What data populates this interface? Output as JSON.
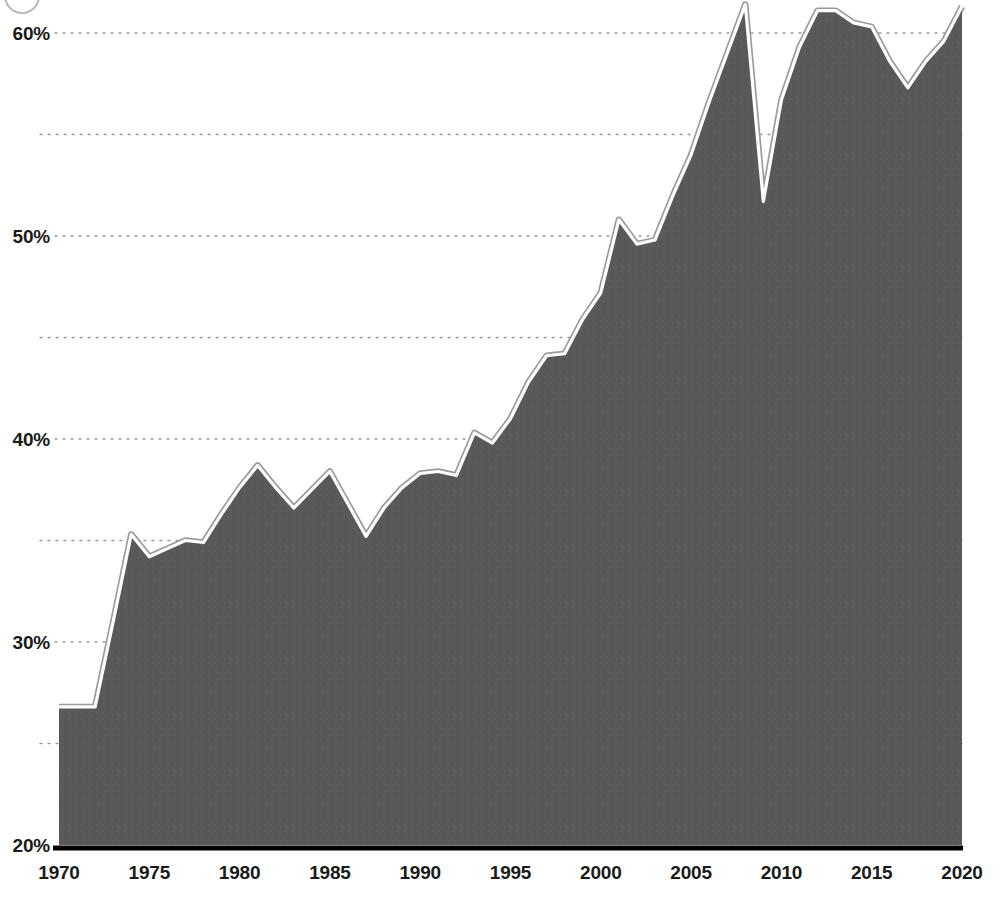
{
  "chart_data": {
    "type": "area",
    "title": "",
    "xlabel": "",
    "ylabel": "",
    "xlim": [
      1970,
      2020
    ],
    "ylim": [
      20,
      62
    ],
    "grid": true,
    "legend": null,
    "y_tick_labels": [
      "60%",
      "50%",
      "40%",
      "30%",
      "20%"
    ],
    "y_ticks": [
      60,
      50,
      40,
      30,
      20
    ],
    "y_minor_gridlines": [
      55,
      45,
      35,
      25
    ],
    "x_tick_labels": [
      "1970",
      "1975",
      "1980",
      "1985",
      "1990",
      "1995",
      "2000",
      "2005",
      "2010",
      "2015",
      "2020"
    ],
    "x_ticks": [
      1970,
      1975,
      1980,
      1985,
      1990,
      1995,
      2000,
      2005,
      2010,
      2015,
      2020
    ],
    "x": [
      1970,
      1971,
      1972,
      1973,
      1974,
      1975,
      1976,
      1977,
      1978,
      1979,
      1980,
      1981,
      1982,
      1983,
      1984,
      1985,
      1986,
      1987,
      1988,
      1989,
      1990,
      1991,
      1992,
      1993,
      1994,
      1995,
      1996,
      1997,
      1998,
      1999,
      2000,
      2001,
      2002,
      2003,
      2004,
      2005,
      2006,
      2007,
      2008,
      2009,
      2010,
      2011,
      2012,
      2013,
      2014,
      2015,
      2016,
      2017,
      2018,
      2019,
      2020
    ],
    "values": [
      26.8,
      26.8,
      26.8,
      31.0,
      35.3,
      34.2,
      34.6,
      35.0,
      34.9,
      36.3,
      37.6,
      38.7,
      37.6,
      36.6,
      37.5,
      38.4,
      36.8,
      35.2,
      36.6,
      37.6,
      38.3,
      38.4,
      38.2,
      40.3,
      39.8,
      41.0,
      42.8,
      44.1,
      44.2,
      45.9,
      47.2,
      50.8,
      49.6,
      49.8,
      52.0,
      54.0,
      56.6,
      59.0,
      61.4,
      51.7,
      56.7,
      59.3,
      61.1,
      61.1,
      60.5,
      60.3,
      58.6,
      57.3,
      58.6,
      59.6,
      61.3
    ],
    "series_name": "",
    "colors": {
      "area_fill": "#595959",
      "area_stroke": "#ffffff",
      "area_stroke_outer": "#9a9a9a",
      "gridline": "#9a9a9a",
      "axis_line": "#000000",
      "label_text": "#1a1a1a",
      "background": "#ffffff"
    }
  }
}
